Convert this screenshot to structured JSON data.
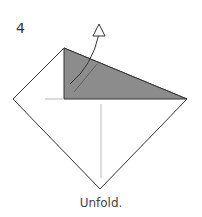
{
  "diagram": {
    "step_number": "4",
    "caption": "Unfold.",
    "colors": {
      "paper_edge": "#333333",
      "shaded_flap": "#8c8c8c",
      "crease_line": "#bbbbbb",
      "arrow": "#333333"
    },
    "shapes": {
      "square_vertices": [
        [
          64,
          48
        ],
        [
          187,
          99
        ],
        [
          100,
          189
        ],
        [
          13,
          99
        ]
      ],
      "shaded_triangle": [
        [
          64,
          48
        ],
        [
          64,
          99
        ],
        [
          187,
          99
        ]
      ],
      "horizontal_crease": [
        [
          45,
          99
        ],
        [
          64,
          99
        ]
      ],
      "vertical_crease": [
        [
          101,
          104
        ],
        [
          101,
          178
        ]
      ]
    }
  }
}
